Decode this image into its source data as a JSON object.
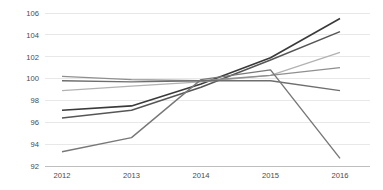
{
  "chart_data": {
    "type": "line",
    "title": "",
    "subtitle": "",
    "xlabel": "",
    "ylabel": "",
    "categories": [
      "2012",
      "2013",
      "2014",
      "2015",
      "2016"
    ],
    "x": [
      2012,
      2013,
      2014,
      2015,
      2016
    ],
    "ylim": [
      92,
      106
    ],
    "xlim": [
      2012,
      2016
    ],
    "yticks": [
      92,
      94,
      96,
      98,
      100,
      102,
      104,
      106
    ],
    "ytick_labels": [
      "92",
      "94",
      "96",
      "98",
      "100",
      "102",
      "104",
      "106"
    ],
    "xtick_labels": [
      "2012",
      "2013",
      "2014",
      "2015",
      "2016"
    ],
    "grid": "horizontal",
    "legend": "none",
    "series": [
      {
        "name": "Series 1",
        "color": "#3a3a3a",
        "width": 1.6,
        "values": [
          97.1,
          97.5,
          99.5,
          101.9,
          105.5
        ]
      },
      {
        "name": "Series 2",
        "color": "#565656",
        "width": 1.5,
        "values": [
          96.4,
          97.1,
          99.2,
          101.7,
          104.3
        ]
      },
      {
        "name": "Series 3",
        "color": "#b2b2b2",
        "width": 1.3,
        "values": [
          98.9,
          99.3,
          99.7,
          100.3,
          102.4
        ]
      },
      {
        "name": "Series 4",
        "color": "#8f8f8f",
        "width": 1.3,
        "values": [
          100.2,
          99.9,
          99.8,
          100.3,
          101.0
        ]
      },
      {
        "name": "Series 5",
        "color": "#6e6e6e",
        "width": 1.4,
        "values": [
          99.8,
          99.7,
          99.8,
          99.8,
          98.9
        ]
      },
      {
        "name": "Series 6",
        "color": "#787878",
        "width": 1.4,
        "values": [
          93.3,
          94.6,
          99.9,
          100.8,
          92.7
        ]
      }
    ],
    "colors": {
      "grid": "#e2e2e2",
      "axis": "#b9b9b9",
      "text": "#4a4a4a",
      "background": "#ffffff"
    }
  },
  "plot_geometry": {
    "left": 45,
    "right": 370,
    "top": 13,
    "bottom": 166,
    "x_first": 62,
    "x_last": 340
  }
}
